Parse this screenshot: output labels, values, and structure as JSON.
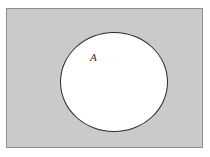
{
  "diagram": {
    "type": "venn-diagram",
    "title": "",
    "universe": {
      "name": "universal-set-rectangle",
      "label": "",
      "fill_color": "#cacaca",
      "stroke_color": "#8f8f8f",
      "x": 6,
      "y": 8,
      "width": 197,
      "height": 140
    },
    "sets": [
      {
        "name": "set-a",
        "label": "A",
        "shape": "ellipse",
        "fill_color": "#ffffff",
        "stroke_color": "#2a2a2a",
        "center_x": 114,
        "center_y": 82,
        "radius_x": 54,
        "radius_y": 50,
        "label_x": 94,
        "label_y": 58
      }
    ],
    "background_color": "#ffffff"
  }
}
